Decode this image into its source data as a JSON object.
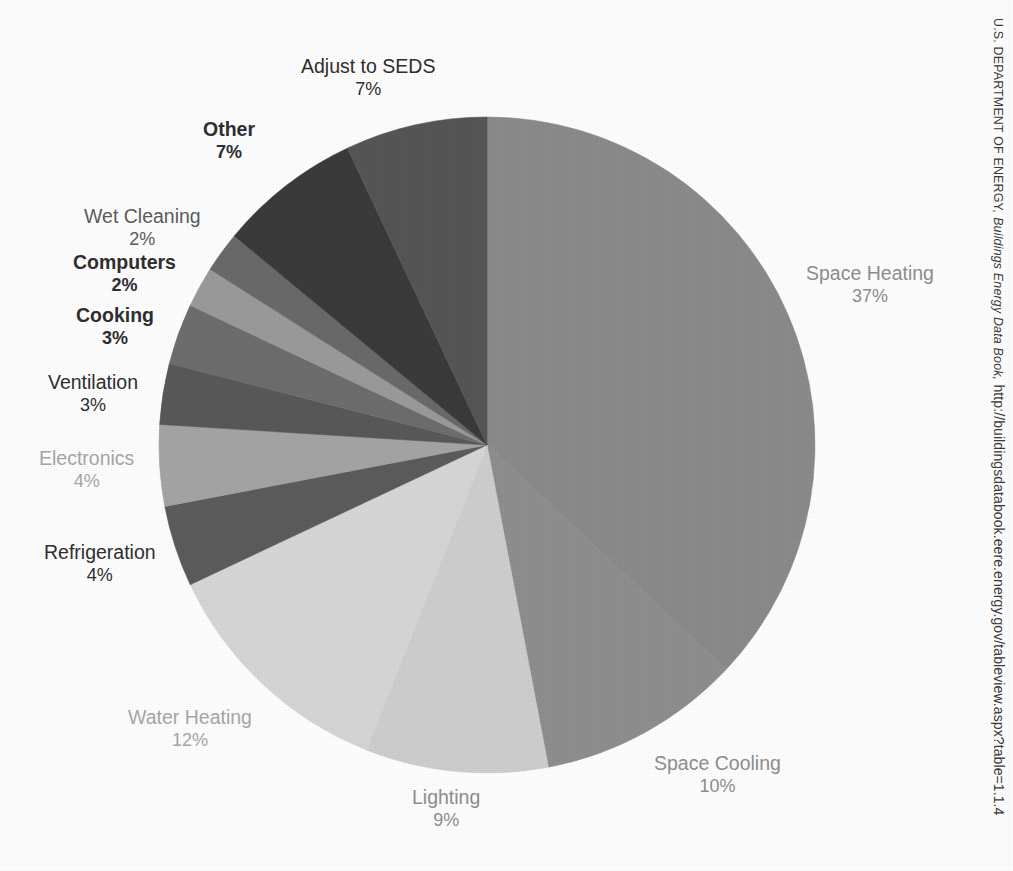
{
  "chart_data": {
    "type": "pie",
    "title": "",
    "subtitle": "",
    "xlabel": "",
    "ylabel": "",
    "legend_position": "none",
    "labels_position": "outside",
    "start_angle_deg": 0,
    "direction": "clockwise",
    "unit": "%",
    "categories": [
      "Space Heating",
      "Space Cooling",
      "Lighting",
      "Water Heating",
      "Refrigeration",
      "Electronics",
      "Ventilation",
      "Cooking",
      "Computers",
      "Wet Cleaning",
      "Other",
      "Adjust to SEDS"
    ],
    "values": [
      37,
      10,
      9,
      12,
      4,
      4,
      3,
      3,
      2,
      2,
      7,
      7
    ],
    "slice_colors": [
      "#8b8b8b",
      "#8f8f8f",
      "#cfcfcf",
      "#d7d7d7",
      "#5c5c5c",
      "#a5a5a5",
      "#595959",
      "#6e6e6e",
      "#9b9b9b",
      "#6a6a6a",
      "#3b3b3b",
      "#565656"
    ]
  },
  "slices": [
    {
      "name": "Space Heating",
      "percent_label": "37%",
      "ink": "ink-light",
      "bold": false
    },
    {
      "name": "Space Cooling",
      "percent_label": "10%",
      "ink": "ink-light",
      "bold": false
    },
    {
      "name": "Lighting",
      "percent_label": "9%",
      "ink": "ink-light",
      "bold": false
    },
    {
      "name": "Water Heating",
      "percent_label": "12%",
      "ink": "ink-pale",
      "bold": false
    },
    {
      "name": "Refrigeration",
      "percent_label": "4%",
      "ink": "ink-dark",
      "bold": false
    },
    {
      "name": "Electronics",
      "percent_label": "4%",
      "ink": "ink-pale",
      "bold": false
    },
    {
      "name": "Ventilation",
      "percent_label": "3%",
      "ink": "ink-dark",
      "bold": false
    },
    {
      "name": "Cooking",
      "percent_label": "3%",
      "ink": "ink-dark",
      "bold": true
    },
    {
      "name": "Computers",
      "percent_label": "2%",
      "ink": "ink-dark",
      "bold": true
    },
    {
      "name": "Wet Cleaning",
      "percent_label": "2%",
      "ink": "ink-mid",
      "bold": false
    },
    {
      "name": "Other",
      "percent_label": "7%",
      "ink": "ink-dark",
      "bold": true
    },
    {
      "name": "Adjust to SEDS",
      "percent_label": "7%",
      "ink": "ink-dark",
      "bold": false
    }
  ],
  "source": {
    "agency": "U.S. Dᴇᴘᴀʀᴛᴍᴇɴᴛ ᴏғ Eɴᴇʀɢʏ,",
    "agency_plain": "U.S. DEPARTMENT OF ENERGY,",
    "publication": "Buildings Energy Data Book,",
    "url": "http://buildingsdatabook.eere.energy.gov/tableview.aspx?table=1.1.4"
  },
  "colors": {
    "background": "#ffffff",
    "text": "#3b3b3b"
  }
}
